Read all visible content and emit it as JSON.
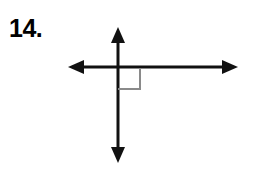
{
  "page": {
    "background_color": "#ffffff",
    "width": 259,
    "height": 173
  },
  "problem": {
    "number_label": "14.",
    "label_color": "#000000"
  },
  "figure": {
    "kind": "perpendicular-lines-diagram",
    "stroke_color": "#111111",
    "stroke_width": 3,
    "right_angle_marker_color": "#8a8a8a",
    "right_angle_marker_stroke_width": 2,
    "intersection": {
      "x": 118,
      "y": 67
    },
    "horizontal_line": {
      "name": "horizontal-double-arrow",
      "x_start": 68,
      "x_end": 238,
      "y": 67,
      "arrowheads": "both",
      "arrowhead_length": 16,
      "arrowhead_half_width": 7
    },
    "vertical_line": {
      "name": "vertical-double-arrow",
      "x": 118,
      "y_start": 27,
      "y_end": 163,
      "arrowheads": "both",
      "arrowhead_length": 16,
      "arrowhead_half_width": 7
    },
    "right_angle_marker": {
      "name": "right-angle-square",
      "quadrant": "lower-right",
      "x": 118,
      "y": 67,
      "size": 22
    }
  }
}
